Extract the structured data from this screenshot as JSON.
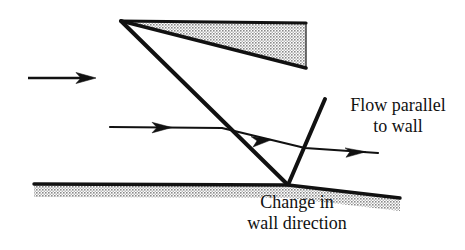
{
  "figure": {
    "title_present": false,
    "background_color": "#ffffff",
    "line_color": "#111111",
    "hatch_color": "#888888",
    "labels": {
      "flow_parallel": {
        "line1": "Flow parallel",
        "line2": "to wall"
      },
      "change_in_wall": {
        "line1": "Change in",
        "line2": "wall direction"
      }
    },
    "diagram_data": {
      "type": "schematic",
      "description": "Supersonic oblique shock diagram: flow over a wedge body above a wall with a change in wall direction producing a reflected shock so the flow becomes parallel to the wall",
      "elements": [
        {
          "name": "wedge-body",
          "kind": "filled-hatched-polygon",
          "points": [
            [
              121,
              21
            ],
            [
              306,
              23
            ],
            [
              306,
              68
            ]
          ],
          "apex": [
            121,
            21
          ]
        },
        {
          "name": "incident-shock",
          "kind": "thick-line",
          "points": [
            [
              121,
              21
            ],
            [
              288,
              185
            ]
          ]
        },
        {
          "name": "reflected-shock",
          "kind": "thick-line",
          "points": [
            [
              288,
              185
            ],
            [
              325,
              99
            ]
          ]
        },
        {
          "name": "lower-wall-upstream",
          "kind": "hatched-band",
          "points": [
            [
              34,
              184
            ],
            [
              288,
              185
            ]
          ],
          "band_depth": 13
        },
        {
          "name": "lower-wall-downstream",
          "kind": "hatched-band",
          "points": [
            [
              288,
              185
            ],
            [
              400,
              198
            ]
          ],
          "band_depth": 13
        },
        {
          "name": "freestream-arrow",
          "kind": "arrow",
          "points": [
            [
              28,
              78
            ],
            [
              96,
              78
            ]
          ]
        },
        {
          "name": "streamline",
          "kind": "polyline-with-arrowheads",
          "points": [
            [
              110,
              127
            ],
            [
              222,
              128
            ],
            [
              305,
              148
            ],
            [
              378,
              153
            ]
          ],
          "arrowheads_at": [
            [
              168,
              127
            ],
            [
              268,
              142
            ],
            [
              362,
              152
            ]
          ]
        }
      ],
      "annotations": [
        {
          "name": "flow-parallel-label",
          "text": "Flow parallel to wall",
          "position": [
            398,
            106
          ]
        },
        {
          "name": "change-in-wall-label",
          "text": "Change in wall direction",
          "position": [
            297,
            203
          ]
        }
      ]
    }
  }
}
